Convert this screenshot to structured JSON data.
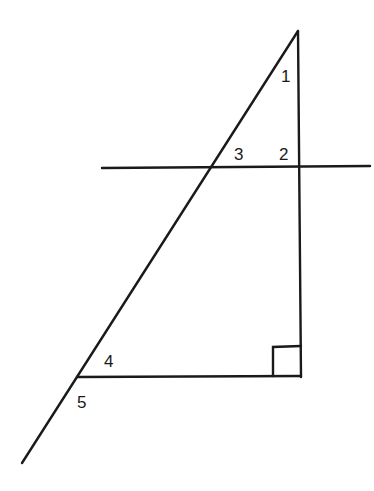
{
  "diagram": {
    "type": "geometry",
    "angle_labels": {
      "a1": "1",
      "a2": "2",
      "a3": "3",
      "a4": "4",
      "a5": "5"
    },
    "right_angle_marker": true,
    "stroke_color": "#1a1a1a",
    "background": "#ffffff"
  }
}
